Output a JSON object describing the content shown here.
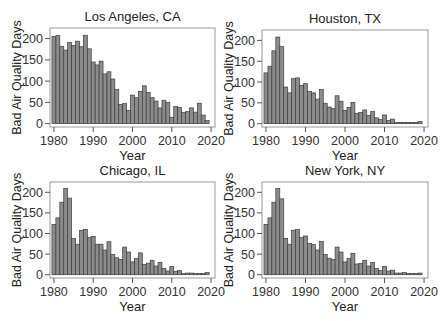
{
  "figure": {
    "xlabel": "Year",
    "ylabel": "Bad Air Quality Days",
    "colors": {
      "bar_fill": "#8c8c8c",
      "bar_edge": "#3c3c3c",
      "frame": "#9a9a9a",
      "axis": "#555555"
    }
  },
  "chart_data": [
    {
      "type": "bar",
      "title": "Los Angeles, CA",
      "xlabel": "Year",
      "ylabel": "Bad Air Quality Days",
      "xticks": [
        1980,
        1990,
        2000,
        2010,
        2020
      ],
      "yticks": [
        0,
        50,
        100,
        150,
        200
      ],
      "xlim": [
        1979,
        2021
      ],
      "ylim": [
        -8,
        225
      ],
      "grid": false,
      "categories": [
        1980,
        1981,
        1982,
        1983,
        1984,
        1985,
        1986,
        1987,
        1988,
        1989,
        1990,
        1991,
        1992,
        1993,
        1994,
        1995,
        1996,
        1997,
        1998,
        1999,
        2000,
        2001,
        2002,
        2003,
        2004,
        2005,
        2006,
        2007,
        2008,
        2009,
        2010,
        2011,
        2012,
        2013,
        2014,
        2015,
        2016,
        2017,
        2018,
        2019
      ],
      "values": [
        205,
        207,
        182,
        173,
        191,
        184,
        194,
        181,
        208,
        176,
        145,
        138,
        147,
        117,
        122,
        105,
        80,
        45,
        47,
        31,
        67,
        61,
        76,
        89,
        73,
        61,
        53,
        37,
        55,
        50,
        15,
        40,
        38,
        26,
        28,
        37,
        27,
        48,
        20,
        7
      ]
    },
    {
      "type": "bar",
      "title": "Houston, TX",
      "xlabel": "Year",
      "ylabel": "Bad Air Quality Days",
      "xticks": [
        1980,
        1990,
        2000,
        2010,
        2020
      ],
      "yticks": [
        0,
        50,
        100,
        150,
        200
      ],
      "xlim": [
        1979,
        2021
      ],
      "ylim": [
        -8,
        225
      ],
      "grid": false,
      "categories": [
        1980,
        1981,
        1982,
        1983,
        1984,
        1985,
        1986,
        1987,
        1988,
        1989,
        1990,
        1991,
        1992,
        1993,
        1994,
        1995,
        1996,
        1997,
        1998,
        1999,
        2000,
        2001,
        2002,
        2003,
        2004,
        2005,
        2006,
        2007,
        2008,
        2009,
        2010,
        2011,
        2012,
        2013,
        2014,
        2015,
        2016,
        2017,
        2018,
        2019
      ],
      "values": [
        122,
        138,
        175,
        208,
        185,
        88,
        74,
        108,
        110,
        92,
        96,
        77,
        74,
        59,
        82,
        49,
        40,
        36,
        67,
        54,
        32,
        39,
        51,
        25,
        27,
        33,
        20,
        29,
        14,
        10,
        21,
        8,
        11,
        3,
        3,
        3,
        3,
        3,
        3,
        5
      ]
    },
    {
      "type": "bar",
      "title": "Chicago, IL",
      "xlabel": "Year",
      "ylabel": "Bad Air Quality Days",
      "xticks": [
        1980,
        1990,
        2000,
        2010,
        2020
      ],
      "yticks": [
        0,
        50,
        100,
        150,
        200
      ],
      "xlim": [
        1979,
        2021
      ],
      "ylim": [
        -8,
        225
      ],
      "grid": false,
      "categories": [
        1980,
        1981,
        1982,
        1983,
        1984,
        1985,
        1986,
        1987,
        1988,
        1989,
        1990,
        1991,
        1992,
        1993,
        1994,
        1995,
        1996,
        1997,
        1998,
        1999,
        2000,
        2001,
        2002,
        2003,
        2004,
        2005,
        2006,
        2007,
        2008,
        2009,
        2010,
        2011,
        2012,
        2013,
        2014,
        2015,
        2016,
        2017,
        2018,
        2019
      ],
      "values": [
        122,
        138,
        176,
        209,
        186,
        88,
        74,
        107,
        110,
        90,
        93,
        74,
        74,
        60,
        80,
        49,
        41,
        37,
        67,
        55,
        31,
        39,
        53,
        25,
        28,
        35,
        21,
        30,
        15,
        9,
        20,
        8,
        10,
        3,
        4,
        4,
        3,
        3,
        3,
        5
      ]
    },
    {
      "type": "bar",
      "title": "New York, NY",
      "xlabel": "Year",
      "ylabel": "Bad Air Quality Days",
      "xticks": [
        1980,
        1990,
        2000,
        2010,
        2020
      ],
      "yticks": [
        0,
        50,
        100,
        150,
        200
      ],
      "xlim": [
        1979,
        2021
      ],
      "ylim": [
        -8,
        225
      ],
      "grid": false,
      "categories": [
        1980,
        1981,
        1982,
        1983,
        1984,
        1985,
        1986,
        1987,
        1988,
        1989,
        1990,
        1991,
        1992,
        1993,
        1994,
        1995,
        1996,
        1997,
        1998,
        1999,
        2000,
        2001,
        2002,
        2003,
        2004,
        2005,
        2006,
        2007,
        2008,
        2009,
        2010,
        2011,
        2012,
        2013,
        2014,
        2015,
        2016,
        2017,
        2018,
        2019
      ],
      "values": [
        122,
        138,
        176,
        209,
        184,
        88,
        74,
        108,
        110,
        90,
        94,
        76,
        73,
        60,
        81,
        49,
        40,
        37,
        67,
        55,
        31,
        39,
        52,
        26,
        27,
        35,
        21,
        30,
        15,
        10,
        20,
        9,
        11,
        4,
        4,
        5,
        3,
        3,
        3,
        4
      ]
    }
  ]
}
